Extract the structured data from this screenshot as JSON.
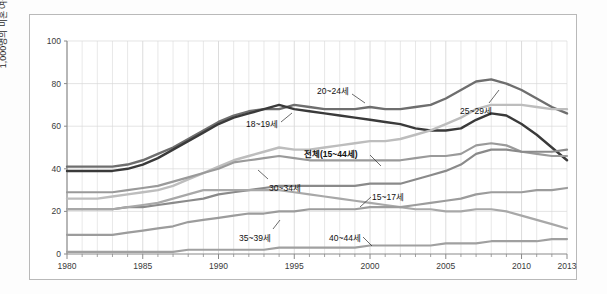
{
  "chart_data": {
    "type": "line",
    "title": "",
    "xlabel": "",
    "ylabel": "1,000명의 미혼 여성당 출생 수",
    "xlim": [
      1980,
      2013
    ],
    "ylim": [
      0,
      100
    ],
    "yticks": [
      0,
      20,
      40,
      60,
      80,
      100
    ],
    "xticks": [
      1980,
      1985,
      1990,
      1995,
      2000,
      2005,
      2010,
      2013
    ],
    "grid": true,
    "legend_position": "inline-annotations",
    "x": [
      1980,
      1981,
      1982,
      1983,
      1984,
      1985,
      1986,
      1987,
      1988,
      1989,
      1990,
      1991,
      1992,
      1993,
      1994,
      1995,
      1996,
      1997,
      1998,
      1999,
      2000,
      2001,
      2002,
      2003,
      2004,
      2005,
      2006,
      2007,
      2008,
      2009,
      2010,
      2011,
      2012,
      2013
    ],
    "series": [
      {
        "name": "20~24세",
        "label": "20~24세",
        "color": "#6e6e6e",
        "width": 2.4,
        "values": [
          41,
          41,
          41,
          41,
          42,
          44,
          47,
          50,
          54,
          58,
          62,
          65,
          67,
          68,
          68,
          70,
          69,
          68,
          68,
          68,
          69,
          68,
          68,
          69,
          70,
          73,
          77,
          81,
          82,
          80,
          77,
          73,
          69,
          66
        ]
      },
      {
        "name": "18~19세",
        "label": "18~19세",
        "color": "#3a3a3a",
        "width": 2.4,
        "values": [
          39,
          39,
          39,
          39,
          40,
          42,
          45,
          49,
          53,
          57,
          61,
          64,
          66,
          68,
          70,
          68,
          67,
          66,
          65,
          64,
          63,
          62,
          61,
          59,
          58,
          58,
          59,
          63,
          66,
          65,
          61,
          56,
          50,
          44
        ]
      },
      {
        "name": "25~29세",
        "label": "25~29세",
        "color": "#bdbdbd",
        "width": 2.4,
        "values": [
          26,
          26,
          26,
          27,
          28,
          29,
          30,
          32,
          35,
          38,
          41,
          44,
          46,
          48,
          50,
          49,
          49,
          50,
          51,
          52,
          53,
          53,
          54,
          56,
          58,
          61,
          64,
          68,
          70,
          70,
          70,
          69,
          68,
          68
        ]
      },
      {
        "name": "전체(15~44세)",
        "label": "전체(15~44세)",
        "color": "#9a9a9a",
        "width": 2.2,
        "values": [
          29,
          29,
          29,
          29,
          30,
          31,
          32,
          34,
          36,
          38,
          40,
          43,
          44,
          45,
          46,
          45,
          44,
          44,
          44,
          44,
          44,
          44,
          44,
          45,
          46,
          46,
          47,
          51,
          52,
          51,
          48,
          47,
          46,
          46
        ]
      },
      {
        "name": "30~34세",
        "label": "30~34세",
        "color": "#8a8a8a",
        "width": 2.2,
        "values": [
          21,
          21,
          21,
          21,
          22,
          22,
          23,
          24,
          25,
          26,
          28,
          29,
          30,
          31,
          32,
          32,
          32,
          32,
          32,
          32,
          33,
          33,
          33,
          35,
          37,
          39,
          42,
          47,
          49,
          49,
          48,
          48,
          48,
          49
        ]
      },
      {
        "name": "15~17세",
        "label": "15~17세",
        "color": "#a8a8a8",
        "width": 2.2,
        "values": [
          21,
          21,
          21,
          21,
          22,
          23,
          24,
          26,
          28,
          30,
          30,
          30,
          30,
          30,
          30,
          29,
          28,
          27,
          26,
          25,
          24,
          23,
          22,
          21,
          21,
          20,
          20,
          21,
          21,
          20,
          18,
          16,
          14,
          12
        ]
      },
      {
        "name": "35~39세",
        "label": "35~39세",
        "color": "#9c9c9c",
        "width": 2.2,
        "values": [
          9,
          9,
          9,
          9,
          10,
          11,
          12,
          13,
          15,
          16,
          17,
          18,
          19,
          19,
          20,
          20,
          21,
          21,
          21,
          21,
          22,
          22,
          22,
          23,
          24,
          25,
          26,
          28,
          29,
          29,
          29,
          30,
          30,
          31
        ]
      },
      {
        "name": "40~44세",
        "label": "40~44세",
        "color": "#a0a0a0",
        "width": 2.2,
        "values": [
          1,
          1,
          1,
          1,
          1,
          1,
          1,
          1,
          2,
          2,
          2,
          2,
          2,
          2,
          3,
          3,
          3,
          3,
          3,
          3,
          4,
          4,
          4,
          4,
          4,
          5,
          5,
          5,
          6,
          6,
          6,
          6,
          7,
          7
        ]
      }
    ],
    "annotations": [
      {
        "text": "20~24세",
        "x": 317,
        "y": 84,
        "bold": false,
        "leader": [
          [
            352,
            94
          ],
          [
            365,
            103
          ]
        ]
      },
      {
        "text": "25~29세",
        "x": 460,
        "y": 104,
        "bold": false,
        "leader": [
          [
            489,
            103
          ],
          [
            499,
            90
          ]
        ]
      },
      {
        "text": "18~19세",
        "x": 246,
        "y": 117,
        "bold": false,
        "leader": [
          [
            281,
            122
          ],
          [
            292,
            113
          ]
        ]
      },
      {
        "text": "전체(15~44세)",
        "x": 304,
        "y": 147,
        "bold": true,
        "leader": [
          [
            370,
            155
          ],
          [
            381,
            166
          ]
        ]
      },
      {
        "text": "30~34세",
        "x": 269,
        "y": 181,
        "bold": false,
        "leader": [
          [
            268,
            179
          ],
          [
            258,
            170
          ]
        ]
      },
      {
        "text": "15~17세",
        "x": 372,
        "y": 190,
        "bold": false,
        "leader": [
          [
            371,
            197
          ],
          [
            360,
            207
          ]
        ]
      },
      {
        "text": "35~39세",
        "x": 239,
        "y": 231,
        "bold": false,
        "leader": [
          [
            273,
            229
          ],
          [
            280,
            220
          ]
        ]
      },
      {
        "text": "40~44세",
        "x": 329,
        "y": 231,
        "bold": false,
        "leader": [
          [
            363,
            237
          ],
          [
            372,
            246
          ]
        ]
      }
    ]
  }
}
